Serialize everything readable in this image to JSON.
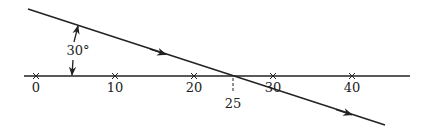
{
  "diagram": {
    "type": "ray-crossing-number-line",
    "angle_label": "30°",
    "axis": {
      "ticks": [
        {
          "value": 0,
          "label": "0"
        },
        {
          "value": 10,
          "label": "10"
        },
        {
          "value": 20,
          "label": "20"
        },
        {
          "value": 30,
          "label": "30"
        },
        {
          "value": 40,
          "label": "40"
        }
      ],
      "marker": {
        "value": 25,
        "label": "25"
      }
    },
    "colors": {
      "stroke": "#222222",
      "background": "#ffffff"
    }
  }
}
